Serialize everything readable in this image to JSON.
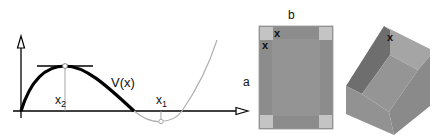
{
  "graph": {
    "curve_label": "V(x)",
    "max_label": "x",
    "max_sub": "2",
    "min_label": "x",
    "min_sub": "1",
    "curve_color": "#000000",
    "extension_color": "#b0b0b0"
  },
  "sheet": {
    "width_label": "b",
    "height_label": "a",
    "cut_label_1": "x",
    "cut_label_2": "x",
    "sheet_color": "#8c8c8c",
    "inner_color": "#949494",
    "corner_color": "#c4c4c4"
  },
  "box": {
    "height_label": "x",
    "top_color": "#a5a5a5",
    "wall_dark": "#6e6e6e",
    "wall_mid": "#8e8e8e",
    "floor_color": "#959595"
  }
}
